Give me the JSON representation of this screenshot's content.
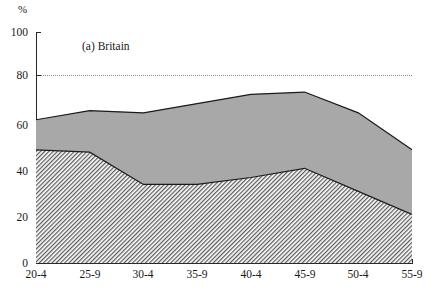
{
  "chart_data": {
    "type": "area",
    "title": "(a)  Britain",
    "xlabel": "",
    "ylabel": "%",
    "ylim": [
      0,
      100
    ],
    "xlim_categories": [
      "20-4",
      "25-9",
      "30-4",
      "35-9",
      "40-4",
      "45-9",
      "50-4",
      "55-9"
    ],
    "categories": [
      "20-4",
      "25-9",
      "30-4",
      "35-9",
      "40-4",
      "45-9",
      "50-4",
      "55-9"
    ],
    "ytick_labels": [
      "0",
      "20",
      "40",
      "60",
      "80",
      "100"
    ],
    "ytick_values": [
      0,
      20,
      40,
      60,
      80,
      100
    ],
    "grid": "dotted horizontal reference line at 80",
    "gridline_value": 80,
    "legend_position": "none",
    "series": [
      {
        "name": "upper-total",
        "fill": "solid-grey",
        "values": [
          62,
          66,
          65,
          69,
          73,
          74,
          65,
          49
        ]
      },
      {
        "name": "lower-hatched",
        "fill": "diagonal-hatch",
        "values": [
          49,
          48,
          34,
          34,
          37,
          41,
          31,
          21
        ]
      }
    ],
    "colors": {
      "grey_fill": "#a8a8a8",
      "hatch_line": "#4a4a4a",
      "hatch_background": "#ffffff",
      "axis": "#2a2a2a",
      "gridline": "#8a8a8a",
      "curve": "#1a1a1a"
    }
  },
  "axis": {
    "y_unit_label": "%",
    "y_ticks": [
      {
        "label": "100",
        "value": 100
      },
      {
        "label": "80",
        "value": 80
      },
      {
        "label": "60",
        "value": 60
      },
      {
        "label": "40",
        "value": 40
      },
      {
        "label": "20",
        "value": 20
      },
      {
        "label": "0",
        "value": 0
      }
    ],
    "x_ticks": [
      {
        "label": "20-4"
      },
      {
        "label": "25-9"
      },
      {
        "label": "30-4"
      },
      {
        "label": "35-9"
      },
      {
        "label": "40-4"
      },
      {
        "label": "45-9"
      },
      {
        "label": "50-4"
      },
      {
        "label": "55-9"
      }
    ]
  },
  "panel": {
    "title": "(a)  Britain"
  }
}
